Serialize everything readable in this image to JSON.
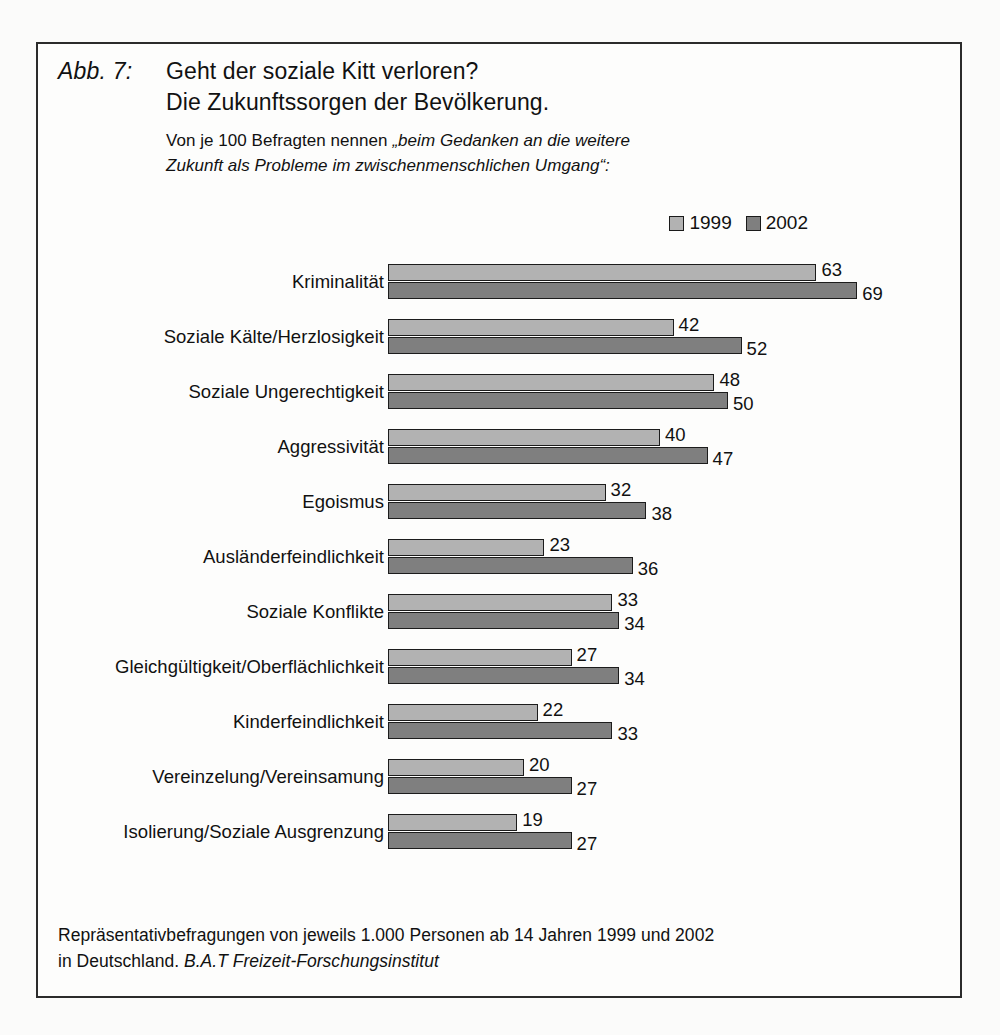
{
  "figure": {
    "label": "Abb. 7:",
    "title_line1": "Geht der soziale Kitt verloren?",
    "title_line2": "Die Zukunftssorgen der Bevölkerung.",
    "subtitle_plain_1": "Von je 100 Befragten nennen ",
    "subtitle_italic_1": "„beim Gedanken an die weitere",
    "subtitle_italic_2": "Zukunft als Probleme im zwischenmenschlichen Umgang“:"
  },
  "legend": {
    "entries": [
      {
        "label": "1999",
        "color": "#b2b2b2"
      },
      {
        "label": "2002",
        "color": "#7f7f7f"
      }
    ]
  },
  "footer": {
    "line1": "Repräsentativbefragungen von jeweils 1.000 Personen ab 14 Jahren 1999 und 2002",
    "line2_plain": "in Deutschland. ",
    "line2_italic": "B.A.T Freizeit-Forschungsinstitut"
  },
  "chart_data": {
    "type": "bar",
    "orientation": "horizontal",
    "title": "Geht der soziale Kitt verloren? Die Zukunftssorgen der Bevölkerung.",
    "subtitle": "Von je 100 Befragten nennen „beim Gedanken an die weitere Zukunft als Probleme im zwischenmenschlichen Umgang“:",
    "xlabel": "",
    "ylabel": "",
    "xlim": [
      0,
      69
    ],
    "grid": false,
    "legend_position": "top-right",
    "value_labels": true,
    "categories": [
      "Kriminalität",
      "Soziale Kälte/Herzlosigkeit",
      "Soziale Ungerechtigkeit",
      "Aggressivität",
      "Egoismus",
      "Ausländerfeindlichkeit",
      "Soziale Konflikte",
      "Gleichgültigkeit/Oberflächlichkeit",
      "Kinderfeindlichkeit",
      "Vereinzelung/Vereinsamung",
      "Isolierung/Soziale Ausgrenzung"
    ],
    "series": [
      {
        "name": "1999",
        "color": "#b2b2b2",
        "values": [
          63,
          42,
          48,
          40,
          32,
          23,
          33,
          27,
          22,
          20,
          19
        ]
      },
      {
        "name": "2002",
        "color": "#7f7f7f",
        "values": [
          69,
          52,
          50,
          47,
          38,
          36,
          34,
          34,
          33,
          27,
          27
        ]
      }
    ]
  },
  "scale": {
    "px_per_unit": 6.8
  }
}
